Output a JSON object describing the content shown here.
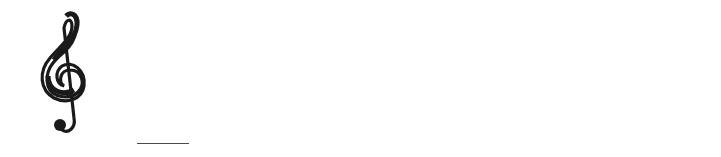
{
  "clef": "treble",
  "colors": {
    "staff": "#3a3a3a",
    "note_fill": "#1a1a1a",
    "note_letter_on_filled": "#ffffff",
    "lyric": "#4a4a4a"
  },
  "staff": {
    "lines_y": [
      36,
      51,
      66,
      81,
      96
    ],
    "x_start": 37,
    "x_end": 686
  },
  "barlines_x": [
    306,
    516
  ],
  "final_barline": {
    "thin_x": 677,
    "thick_x": 684
  },
  "notes": [
    {
      "letter": "D",
      "type": "quarter",
      "cx": 111,
      "cy": 104,
      "stem_x": 120,
      "stem_top": 51,
      "filled": true
    },
    {
      "letter": "E",
      "type": "quarter",
      "cx": 178,
      "cy": 96,
      "stem_x": 188,
      "stem_top": 44,
      "filled": true
    },
    {
      "letter": "F",
      "type": "quarter",
      "cx": 247,
      "cy": 89,
      "stem_x": 257,
      "stem_top": 36,
      "filled": true
    },
    {
      "letter": "E",
      "type": "half",
      "cx": 329,
      "cy": 96,
      "stem_x": 340,
      "stem_top": 43,
      "filled": false
    },
    {
      "letter": "D",
      "type": "quarter",
      "cx": 452,
      "cy": 104,
      "stem_x": 461,
      "stem_top": 51,
      "filled": true
    },
    {
      "letter": "C",
      "type": "dotted-half",
      "cx": 542,
      "cy": 111,
      "stem_x": 553,
      "stem_top": 58,
      "filled": false,
      "ledger_line": true,
      "dot": {
        "cx": 564,
        "cy": 103
      }
    }
  ],
  "lyrics": [
    {
      "text": "cause",
      "x": 86
    },
    {
      "text": "He",
      "x": 236
    },
    {
      "text": "first",
      "x": 312
    },
    {
      "text": "loved",
      "x": 429
    },
    {
      "text": "me.",
      "x": 529
    }
  ],
  "lyric_extender": {
    "x": 137,
    "width": 52
  }
}
